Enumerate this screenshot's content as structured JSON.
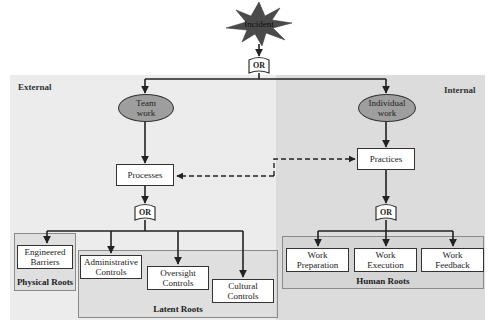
{
  "diagram": {
    "top_event": {
      "label": "Incident",
      "icon": "starburst-icon",
      "color": "#555555"
    },
    "top_gate": {
      "label": "OR"
    },
    "regions": {
      "external": {
        "label": "External",
        "color": "#ececec"
      },
      "internal": {
        "label": "Internal",
        "color": "#dcdcdc"
      }
    },
    "left_branch": {
      "node": {
        "label_line1": "Team",
        "label_line2": "work"
      },
      "process": {
        "label": "Processes"
      },
      "gate": {
        "label": "OR"
      },
      "physical_group": {
        "label": "Physical Roots",
        "items": [
          {
            "line1": "Engineered",
            "line2": "Barriers"
          }
        ]
      },
      "latent_group": {
        "label": "Latent Roots",
        "items": [
          {
            "line1": "Administrative",
            "line2": "Controls"
          },
          {
            "line1": "Oversight",
            "line2": "Controls"
          },
          {
            "line1": "Cultural",
            "line2": "Controls"
          }
        ]
      }
    },
    "right_branch": {
      "node": {
        "label_line1": "Individual",
        "label_line2": "work"
      },
      "process": {
        "label": "Practices"
      },
      "gate": {
        "label": "OR"
      },
      "human_group": {
        "label": "Human Roots",
        "items": [
          {
            "line1": "Work",
            "line2": "Preparation"
          },
          {
            "line1": "Work",
            "line2": "Execution"
          },
          {
            "line1": "Work",
            "line2": "Feedback"
          }
        ]
      }
    },
    "connectors": {
      "dashed": {
        "from": "Practices",
        "to": "Processes",
        "style": "dashed"
      }
    },
    "colors": {
      "node_fill": "#9e9e9e",
      "line": "#222222",
      "group_border": "#8a8a8a"
    }
  }
}
